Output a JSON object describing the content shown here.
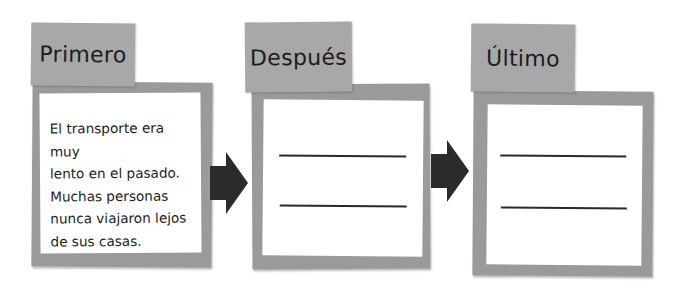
{
  "diagram": {
    "type": "sequence-organizer",
    "boxes": [
      {
        "heading": "Primero",
        "text": "El transporte era muy lento en el pasado. Muchas personas nunca viajaron lejos de sus casas.",
        "lines": [
          "El transporte era muy",
          "lento en el pasado.",
          "Muchas personas",
          "nunca viajaron lejos",
          "de sus casas."
        ]
      },
      {
        "heading": "Después",
        "blank_lines": 2
      },
      {
        "heading": "Último",
        "blank_lines": 2
      }
    ],
    "arrows": [
      "arrow-1-to-2",
      "arrow-2-to-3"
    ],
    "colors": {
      "frame": "#9a9a9a",
      "tab": "#a8a8a8",
      "paper": "#ffffff",
      "arrow": "#2b2b2b",
      "text": "#1c1c1c"
    }
  }
}
